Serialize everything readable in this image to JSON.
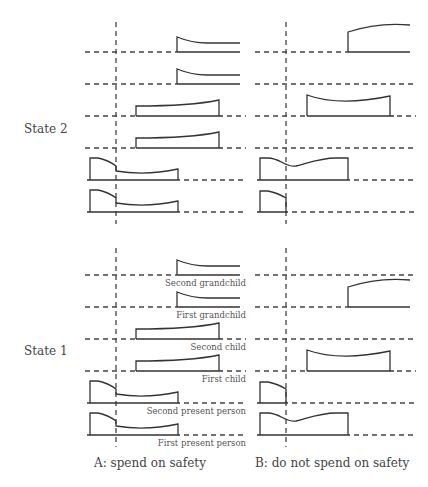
{
  "states": [
    {
      "id": "state2",
      "label": "State 2",
      "show_row_labels": false
    },
    {
      "id": "state1",
      "label": "State 1",
      "show_row_labels": true
    }
  ],
  "row_labels": [
    "Second grandchild",
    "First grandchild",
    "Second child",
    "First child",
    "Second present person",
    "First present person"
  ],
  "panels": [
    {
      "id": "A",
      "label": "A: spend on safety"
    },
    {
      "id": "B",
      "label": "B: do not spend on safety"
    }
  ],
  "profiles": {
    "state2": {
      "A": [
        "grandchild-declining",
        "grandchild-declining",
        "child-rising",
        "child-rising",
        "present-long-drop",
        "present-long-drop"
      ],
      "B": [
        "grandchild-rising",
        "none",
        "child-wavy",
        "none",
        "present-long-wavy",
        "present-short"
      ]
    },
    "state1": {
      "A": [
        "grandchild-declining",
        "grandchild-declining",
        "child-rising",
        "child-rising",
        "present-long-drop",
        "present-long-drop"
      ],
      "B": [
        "none",
        "grandchild-rising",
        "none",
        "child-wavy",
        "present-short",
        "present-long-wavy"
      ]
    }
  },
  "colors": {
    "line": "#333333",
    "dash": "#444444"
  }
}
